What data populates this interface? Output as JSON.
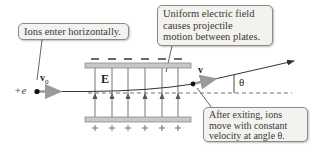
{
  "diagram": {
    "callouts": {
      "enter": "Ions enter horizontally.",
      "field_line1": "Uniform electric field",
      "field_line2": "causes projectile",
      "field_line3": "motion between plates.",
      "exit_line1": "After exiting, ions",
      "exit_line2": "move with constant",
      "exit_line3": "velocity at angle θ."
    },
    "labels": {
      "charge": "+e",
      "initial_velocity": "v",
      "initial_velocity_sub": "0",
      "field": "E",
      "exit_velocity": "v",
      "angle": "θ"
    },
    "plates": {
      "top_sign": "−",
      "bottom_sign": "+",
      "sign_count": 6
    },
    "colors": {
      "plate": "#c8c8c8",
      "plate_border": "#8a8a8a",
      "field_line": "#777777",
      "velocity_arrow": "#9a9a9a",
      "trajectory": "#333333",
      "callout_bg": "#f3f2ee"
    }
  }
}
